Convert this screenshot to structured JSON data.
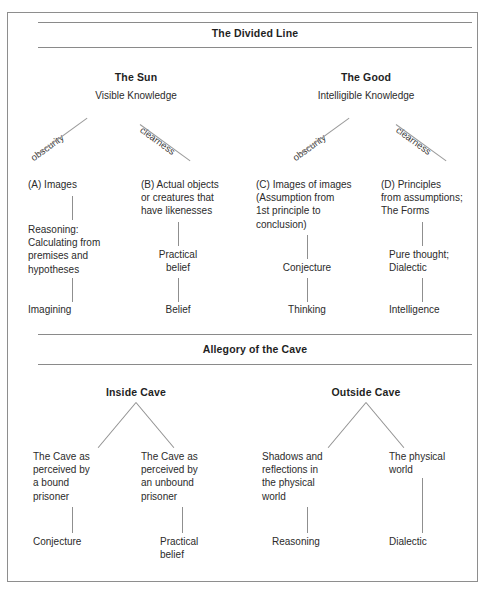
{
  "document": {
    "sections": [
      {
        "id": "divided-line",
        "title": "The Divided Line",
        "halves": [
          {
            "id": "sun",
            "heading": "The Sun",
            "subheading": "Visible Knowledge"
          },
          {
            "id": "good",
            "heading": "The Good",
            "subheading": "Intelligible Knowledge"
          }
        ],
        "axis_labels": [
          {
            "id": "sun-obscurity",
            "text": "obscurity",
            "direction": "ascending"
          },
          {
            "id": "sun-clearness",
            "text": "clearness",
            "direction": "descending"
          },
          {
            "id": "good-obscurity",
            "text": "obscurity",
            "direction": "ascending"
          },
          {
            "id": "good-clearness",
            "text": "clearness",
            "direction": "descending"
          }
        ],
        "columns": [
          {
            "id": "column-a",
            "top": "(A) Images",
            "middle": "Reasoning:\nCalculating from\npremises and\nhypotheses",
            "bottom": "Imagining"
          },
          {
            "id": "column-b",
            "top": "(B) Actual objects\nor creatures that\nhave likenesses",
            "middle": "Practical\nbelief",
            "bottom": "Belief"
          },
          {
            "id": "column-c",
            "top": "(C) Images of images\n(Assumption from\n1st principle to\nconclusion)",
            "middle": "Conjecture",
            "bottom": "Thinking"
          },
          {
            "id": "column-d",
            "top": "(D) Principles\nfrom assumptions;\nThe Forms",
            "middle": "Pure thought;\nDialectic",
            "bottom": "Intelligence"
          }
        ]
      },
      {
        "id": "allegory-of-the-cave",
        "title": "Allegory of the Cave",
        "halves": [
          {
            "id": "inside-cave",
            "heading": "Inside Cave"
          },
          {
            "id": "outside-cave",
            "heading": "Outside Cave"
          }
        ],
        "columns": [
          {
            "id": "cave-column-1",
            "top": "The Cave as\nperceived by\na bound\nprisoner",
            "bottom": "Conjecture"
          },
          {
            "id": "cave-column-2",
            "top": "The Cave as\nperceived by\nan unbound\nprisoner",
            "bottom": "Practical\nbelief"
          },
          {
            "id": "cave-column-3",
            "top": "Shadows and\nreflections in\nthe physical\nworld",
            "bottom": "Reasoning"
          },
          {
            "id": "cave-column-4",
            "top": "The physical\nworld",
            "bottom": "Dialectic"
          }
        ]
      }
    ]
  },
  "colors": {
    "ink": "#2b2b2b",
    "heading_ink": "#1f1f1f",
    "rule": "#8a8a8a",
    "frame": "#8e8e8e",
    "connector": "#8f8f8f",
    "background": "#ffffff"
  }
}
